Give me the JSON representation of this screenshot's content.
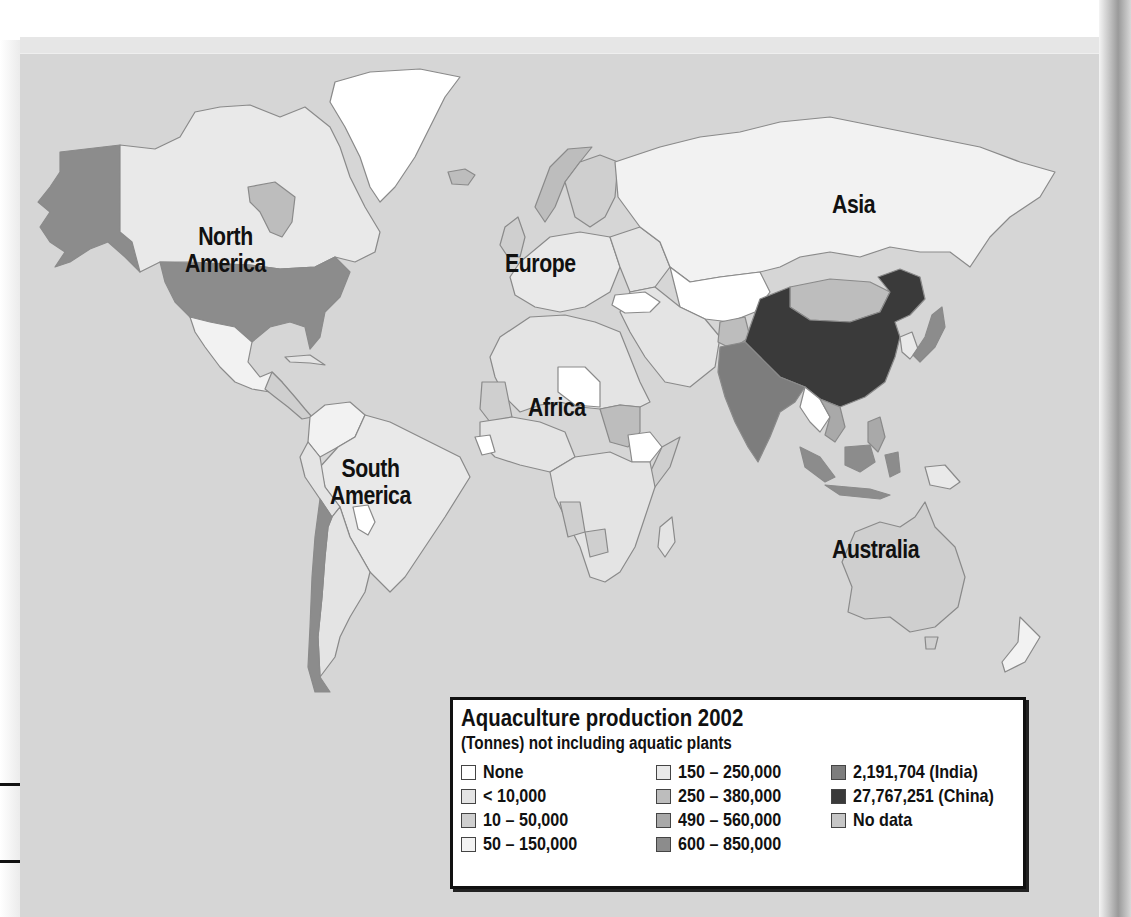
{
  "map": {
    "title": "Aquaculture production 2002",
    "subtitle": "(Tonnes) not including aquatic plants",
    "continents": [
      {
        "id": "north-america",
        "line1": "North",
        "line2": "America"
      },
      {
        "id": "south-america",
        "line1": "South",
        "line2": "America"
      },
      {
        "id": "europe",
        "line1": "Europe",
        "line2": ""
      },
      {
        "id": "africa",
        "line1": "Africa",
        "line2": ""
      },
      {
        "id": "asia",
        "line1": "Asia",
        "line2": ""
      },
      {
        "id": "australia",
        "line1": "Australia",
        "line2": ""
      }
    ],
    "legend": {
      "columns": [
        [
          {
            "label": "None",
            "color": "#ffffff"
          },
          {
            "label": "< 10,000",
            "color": "#e4e4e4"
          },
          {
            "label": "10 – 50,000",
            "color": "#cfcfcf"
          },
          {
            "label": "50 – 150,000",
            "color": "#f2f2f2"
          }
        ],
        [
          {
            "label": "150 – 250,000",
            "color": "#e9e9e9"
          },
          {
            "label": "250 – 380,000",
            "color": "#bdbdbd"
          },
          {
            "label": "490 – 560,000",
            "color": "#a9a9a9"
          },
          {
            "label": "600 – 850,000",
            "color": "#8c8c8c"
          }
        ],
        [
          {
            "label": "2,191,704 (India)",
            "color": "#7d7d7d"
          },
          {
            "label": "27,767,251 (China)",
            "color": "#3a3a3a"
          },
          {
            "label": "No data",
            "color": "#c6c6c6"
          }
        ]
      ]
    },
    "colors": {
      "ocean": "#d6d6d6",
      "border": "#8a8a8a",
      "china": "#3a3a3a",
      "india": "#7d7d7d"
    }
  }
}
